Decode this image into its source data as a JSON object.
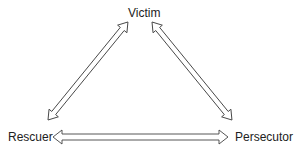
{
  "diagram": {
    "type": "drama-triangle",
    "nodes": {
      "top": {
        "label": "Victim"
      },
      "left": {
        "label": "Rescuer"
      },
      "right": {
        "label": "Persecutor"
      }
    },
    "edges": [
      {
        "from": "Rescuer",
        "to": "Victim",
        "style": "double-headed hollow arrow"
      },
      {
        "from": "Victim",
        "to": "Persecutor",
        "style": "double-headed hollow arrow"
      },
      {
        "from": "Rescuer",
        "to": "Persecutor",
        "style": "double-headed hollow arrow"
      }
    ],
    "colors": {
      "stroke": "#444444",
      "background": "#ffffff"
    }
  }
}
